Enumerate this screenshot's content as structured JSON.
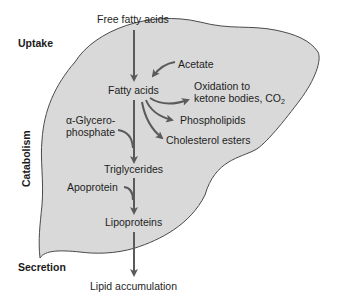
{
  "diagram": {
    "colors": {
      "liver_fill": "#d9d9d9",
      "liver_outline": "#4a4a4a",
      "arrow": "#5a5a5a",
      "text": "#1e1e1e"
    },
    "side_labels": {
      "uptake": "Uptake",
      "catabolism": "Catabolism",
      "secretion": "Secretion"
    },
    "nodes": {
      "free_fatty_acids": "Free fatty acids",
      "acetate": "Acetate",
      "fatty_acids": "Fatty acids",
      "oxidation_line1": "Oxidation to",
      "oxidation_line2": "ketone bodies, CO",
      "oxidation_sub": "2",
      "phospholipids": "Phospholipids",
      "cholesterol_esters": "Cholesterol esters",
      "glycerophosphate_line1": "α-Glycero-",
      "glycerophosphate_line2": "phosphate",
      "triglycerides": "Triglycerides",
      "apoprotein": "Apoprotein",
      "lipoproteins": "Lipoproteins",
      "lipid_accumulation": "Lipid accumulation"
    },
    "edges": [
      {
        "from": "Free fatty acids",
        "to": "Fatty acids"
      },
      {
        "from": "Acetate",
        "to": "Fatty acids"
      },
      {
        "from": "Fatty acids",
        "to": "Oxidation to ketone bodies, CO2"
      },
      {
        "from": "Fatty acids",
        "to": "Phospholipids"
      },
      {
        "from": "Fatty acids",
        "to": "Cholesterol esters"
      },
      {
        "from": "Fatty acids",
        "to": "Triglycerides"
      },
      {
        "from": "α-Glycerophosphate",
        "to": "Triglycerides"
      },
      {
        "from": "Triglycerides",
        "to": "Lipoproteins"
      },
      {
        "from": "Apoprotein",
        "to": "Lipoproteins"
      },
      {
        "from": "Lipoproteins",
        "to": "Lipid accumulation"
      }
    ]
  }
}
